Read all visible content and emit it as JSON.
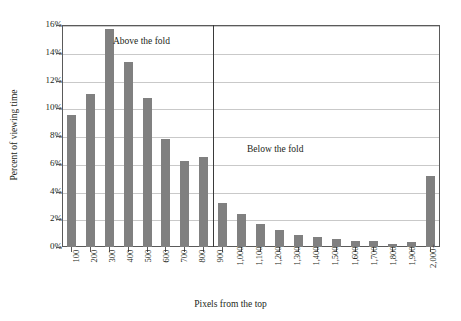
{
  "chart_data": {
    "type": "bar",
    "title": "",
    "xlabel": "Pixels from the top",
    "ylabel": "Percent of viewing time",
    "ylim": [
      0,
      16
    ],
    "ytick_values": [
      0,
      2,
      4,
      6,
      8,
      10,
      12,
      14,
      16
    ],
    "ytick_labels": [
      "0%",
      "2%",
      "4%",
      "6%",
      "8%",
      "10%",
      "12%",
      "14%",
      "16%"
    ],
    "grid": "horizontal",
    "legend": "none",
    "bar_color": "#808080",
    "categories": [
      "100",
      "200",
      "300",
      "400",
      "500",
      "600",
      "700",
      "800",
      "900",
      "1,000",
      "1,100",
      "1,200",
      "1,300",
      "1,400",
      "1,500",
      "1,600",
      "1,700",
      "1,800",
      "1,900",
      "2,000+"
    ],
    "values": [
      9.5,
      11.0,
      15.7,
      13.35,
      10.75,
      7.75,
      6.2,
      6.5,
      3.2,
      2.35,
      1.65,
      1.2,
      0.85,
      0.7,
      0.55,
      0.45,
      0.4,
      0.2,
      0.35,
      5.1
    ],
    "annotations": [
      {
        "text": "Above the fold",
        "category_anchor": "300"
      },
      {
        "text": "Below the fold",
        "category_anchor": "1,300"
      }
    ],
    "reference_line": {
      "label": "fold",
      "after_category": "800",
      "color": "#3a3a3a"
    }
  }
}
